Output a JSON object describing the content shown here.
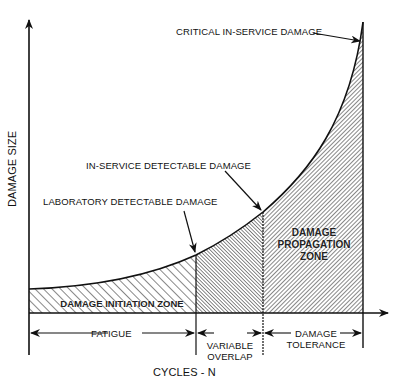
{
  "diagram": {
    "y_axis_label": "DAMAGE SIZE",
    "x_axis_label": "CYCLES - N",
    "annotations": {
      "critical": "CRITICAL IN-SERVICE DAMAGE",
      "in_service": "IN-SERVICE DETECTABLE DAMAGE",
      "laboratory": "LABORATORY DETECTABLE DAMAGE"
    },
    "zones": {
      "initiation": "DAMAGE INITIATION ZONE",
      "propagation_line1": "DAMAGE",
      "propagation_line2": "PROPAGATION",
      "propagation_line3": "ZONE"
    },
    "phases": {
      "fatigue": "FATIGUE",
      "variable_line1": "VARIABLE",
      "variable_line2": "OVERLAP",
      "tolerance_line1": "DAMAGE",
      "tolerance_line2": "TOLERANCE"
    },
    "colors": {
      "ink": "#111111",
      "background": "#ffffff"
    }
  }
}
